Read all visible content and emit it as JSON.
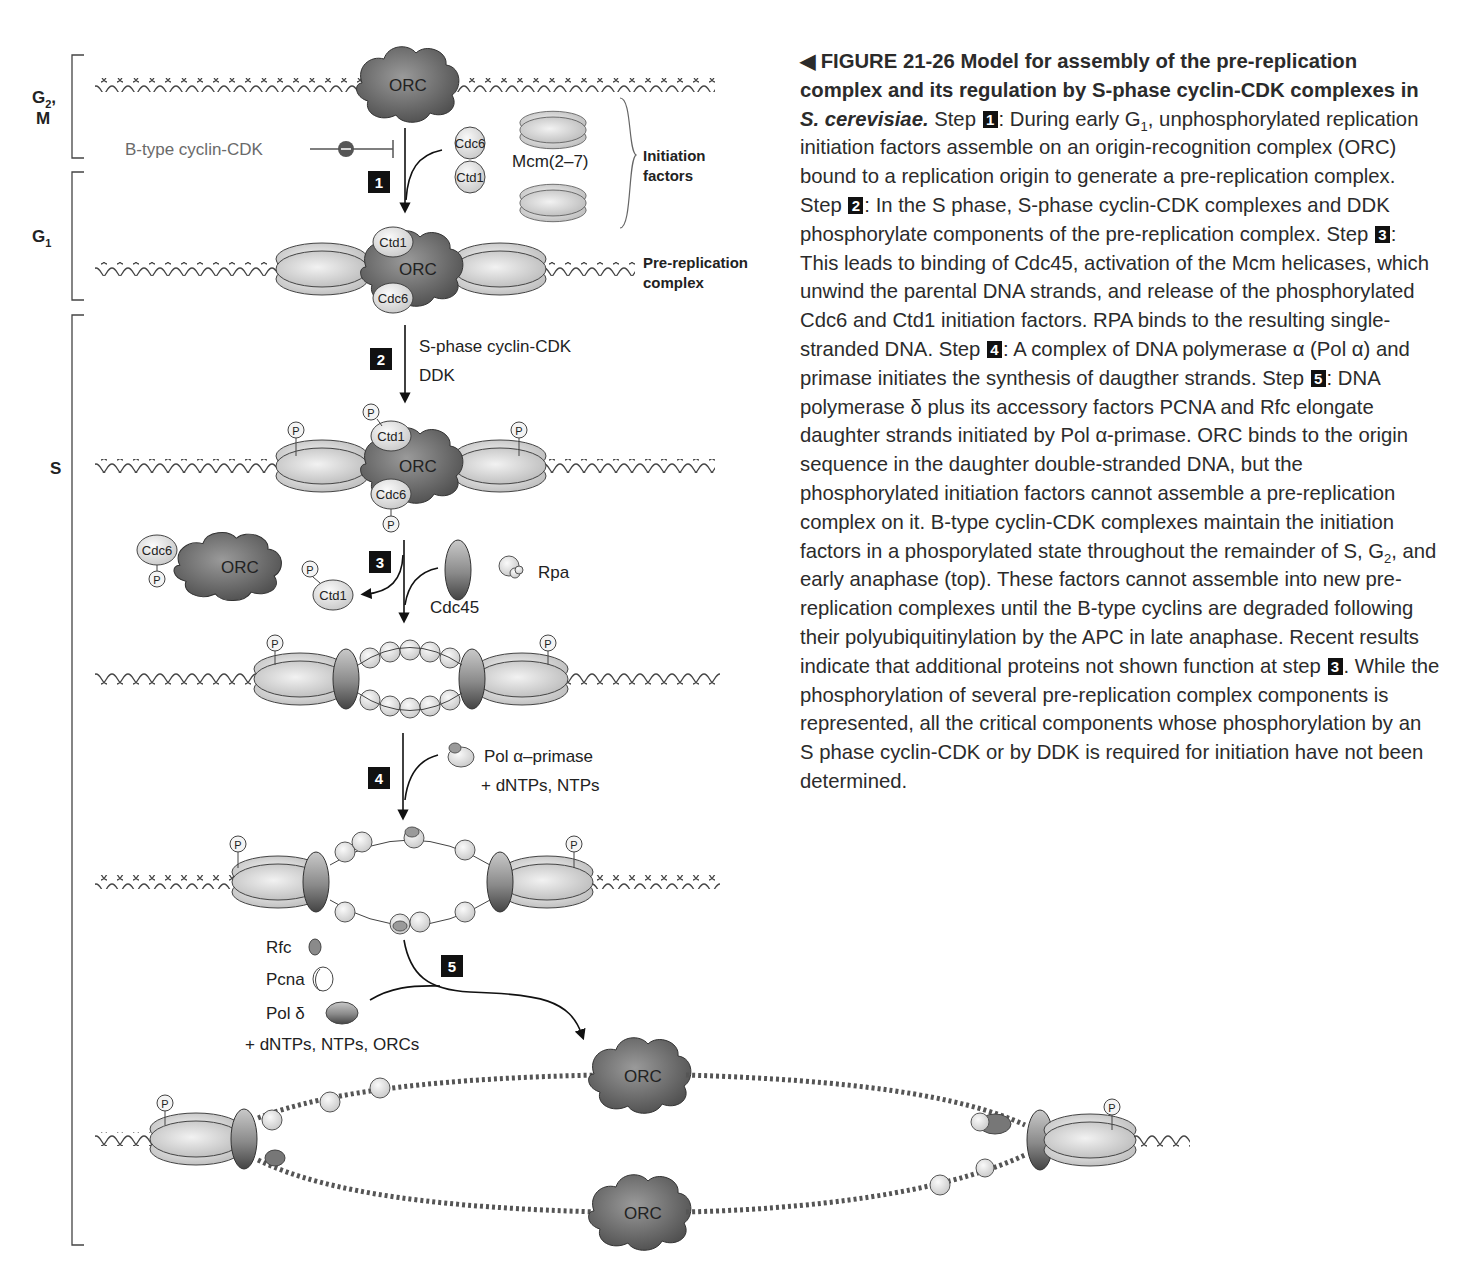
{
  "figure": {
    "number_label": "FIGURE 21-26",
    "title": "Model for assembly of the pre-replication complex and its regulation by S-phase cyclin-CDK complexes in",
    "organism": "S. cerevisiae.",
    "caption_segments": [
      {
        "type": "text",
        "value": " Step "
      },
      {
        "type": "step",
        "value": "1"
      },
      {
        "type": "text",
        "value": ": During early G"
      },
      {
        "type": "sub",
        "value": "1"
      },
      {
        "type": "text",
        "value": ", unphosphorylated replication initiation factors assemble on an origin-recognition complex (ORC) bound to a replication origin to generate a pre-replication complex. Step "
      },
      {
        "type": "step",
        "value": "2"
      },
      {
        "type": "text",
        "value": ": In the S phase, S-phase cyclin-CDK complexes and DDK phosphorylate components of the pre-replication complex. Step "
      },
      {
        "type": "step",
        "value": "3"
      },
      {
        "type": "text",
        "value": ": This leads to binding of Cdc45, activation of the Mcm helicases, which unwind the parental DNA strands, and release of the phosphorylated Cdc6 and Ctd1 initiation factors. RPA binds to the resulting single-stranded DNA. Step "
      },
      {
        "type": "step",
        "value": "4"
      },
      {
        "type": "text",
        "value": ": A complex of DNA polymerase α (Pol α) and primase initiates the synthesis of daugther strands. Step "
      },
      {
        "type": "step",
        "value": "5"
      },
      {
        "type": "text",
        "value": ": DNA polymerase δ plus its accessory factors PCNA and Rfc elongate daughter strands initiated by Pol α-primase. ORC binds to the origin sequence in the daughter double-stranded DNA, but the phosphorylated initiation factors cannot assemble a pre-replication complex on it. B-type cyclin-CDK complexes maintain the initiation factors in a phosporylated state throughout the remainder of S, G"
      },
      {
        "type": "sub",
        "value": "2"
      },
      {
        "type": "text",
        "value": ", and early anaphase (top). These factors cannot assemble into new pre-replication complexes until the B-type cyclins are degraded following their polyubiquitinylation by the APC in late anaphase. Recent results indicate that additional proteins not shown function at step "
      },
      {
        "type": "step",
        "value": "3"
      },
      {
        "type": "text",
        "value": ". While the phosphorylation of several pre-replication complex components is represented, all the critical components whose phosphorylation by an S phase cyclin-CDK or by DDK is required for initiation have not been determined."
      }
    ]
  },
  "phases": {
    "g2m_main": "G",
    "g2m_sub": "2",
    "g2m_suffix": ",",
    "g2m_line2": "M",
    "g1_main": "G",
    "g1_sub": "1",
    "s": "S"
  },
  "labels": {
    "orc": "ORC",
    "cdc6": "Cdc6",
    "ctd1": "Ctd1",
    "mcm": "Mcm(2–7)",
    "phospho": "P",
    "initiation_factors_1": "Initiation",
    "initiation_factors_2": "factors",
    "prerep_1": "Pre-replication",
    "prerep_2": "complex",
    "inhibitor": "B-type cyclin-CDK",
    "s_phase_kinase": "S-phase cyclin-CDK",
    "ddk": "DDK",
    "cdc45": "Cdc45",
    "rpa": "Rpa",
    "pol_alpha": "Pol α–primase",
    "dntps_ntps": "+ dNTPs, NTPs",
    "rfc": "Rfc",
    "pcna": "Pcna",
    "pol_delta": "Pol δ",
    "dntps_ntps_orcs": "+ dNTPs, NTPs, ORCs"
  },
  "steps": [
    "1",
    "2",
    "3",
    "4",
    "5"
  ],
  "colors": {
    "orc": "#6e6e6e",
    "mcm": "#d4d4d4",
    "factor": "#e6e6e6",
    "cdc45": "#8a8a8a",
    "dna": "#555555",
    "step_box": "#111111",
    "inhibitor_text": "#6a6a6a"
  }
}
